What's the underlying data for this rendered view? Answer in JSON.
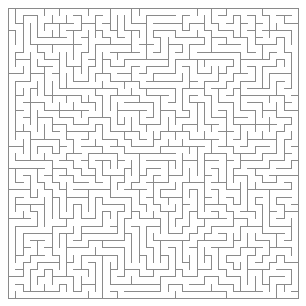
{
  "page": {
    "width": 306,
    "height": 306,
    "background_color": "#ffffff"
  },
  "maze": {
    "name": "rectangular-perfect-maze",
    "type": "orthogonal-grid-maze",
    "cols": 40,
    "rows": 40,
    "cell_size": 7.25,
    "origin_x": 8,
    "origin_y": 8,
    "wall_color": "#8a8a8a",
    "wall_width": 1,
    "background_color": "#ffffff",
    "border_closed": true,
    "entrance": null,
    "exit": null,
    "algorithm": "depth-first-backtracker",
    "seed": 20240517
  }
}
